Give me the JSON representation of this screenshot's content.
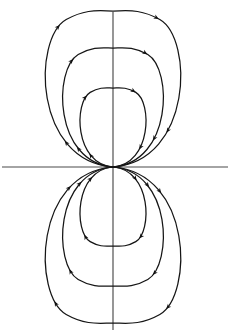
{
  "figure": {
    "background_color": "#ffffff",
    "line_color": "#151515",
    "axis_color": "#4a4a4a",
    "arrow_color": "#101010"
  },
  "chart_data": {
    "type": "line",
    "xlabel": "",
    "ylabel": "",
    "grid": false,
    "legend": false,
    "origin": {
      "x": 113,
      "y": 167,
      "label": "dipole-origin"
    },
    "axes": [
      {
        "name": "horizontal-axis",
        "x1": 2,
        "y1": 167,
        "x2": 228,
        "y2": 167
      },
      {
        "name": "vertical-axis",
        "x1": 113,
        "y1": 12,
        "x2": 113,
        "y2": 330
      }
    ],
    "flow_direction": "clockwise",
    "series": [
      {
        "name": "upper-loop-small",
        "hemisphere": "upper",
        "loop_index": 1,
        "half_width": 38,
        "apex_y": 88,
        "arrow_count": 4
      },
      {
        "name": "upper-loop-medium",
        "hemisphere": "upper",
        "loop_index": 2,
        "half_width": 58,
        "apex_y": 48,
        "arrow_count": 4
      },
      {
        "name": "upper-loop-large",
        "hemisphere": "upper",
        "loop_index": 3,
        "half_width": 78,
        "apex_y": 11,
        "arrow_count": 4
      },
      {
        "name": "lower-loop-small",
        "hemisphere": "lower",
        "loop_index": 1,
        "half_width": 38,
        "apex_y": 246,
        "arrow_count": 4
      },
      {
        "name": "lower-loop-medium",
        "hemisphere": "lower",
        "loop_index": 2,
        "half_width": 58,
        "apex_y": 286,
        "arrow_count": 4
      },
      {
        "name": "lower-loop-large",
        "hemisphere": "lower",
        "loop_index": 3,
        "half_width": 78,
        "apex_y": 323,
        "arrow_count": 4
      }
    ]
  }
}
